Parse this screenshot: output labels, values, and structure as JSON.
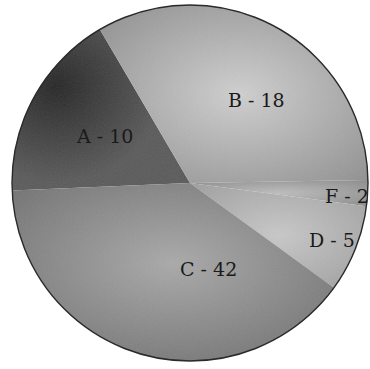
{
  "chart_data": {
    "type": "pie",
    "title": "",
    "categories": [
      "A",
      "B",
      "F",
      "D",
      "C"
    ],
    "values": [
      10,
      18,
      2,
      5,
      42
    ],
    "labels": [
      "A - 10",
      "B - 18",
      "F - 2",
      "D - 5",
      "C - 42"
    ],
    "colors": [
      "#2e2e2e",
      "#a6a6a6",
      "#9a9a9a",
      "#b4b4b4",
      "#7a7a7a"
    ],
    "legend": "none",
    "label_position": "inside"
  },
  "geometry": {
    "cx": 190,
    "cy": 183,
    "r": 178,
    "slices": [
      {
        "key": "A",
        "start": 177.6,
        "end": 239.6,
        "label_x": 77,
        "label_y": 143
      },
      {
        "key": "B",
        "start": 239.6,
        "end": 359.0,
        "label_x": 228,
        "label_y": 107
      },
      {
        "key": "F",
        "start": -1.0,
        "end": 7.5,
        "label_x": 325,
        "label_y": 203
      },
      {
        "key": "D",
        "start": 7.5,
        "end": 36.0,
        "label_x": 309,
        "label_y": 247
      },
      {
        "key": "C",
        "start": 36.0,
        "end": 177.6,
        "label_x": 180,
        "label_y": 276
      }
    ]
  }
}
